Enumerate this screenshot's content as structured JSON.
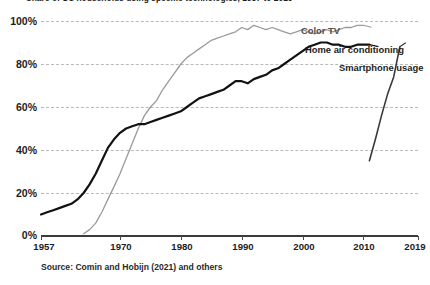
{
  "chart": {
    "title": "Share of US households using specific technologies, 1957 to 2019",
    "source": "Source: Comin and Hobijn (2021) and others"
  },
  "axes": {
    "y_ticks": [
      "0%",
      "20%",
      "40%",
      "60%",
      "80%",
      "100%"
    ],
    "x_ticks": [
      "1957",
      "1970",
      "1980",
      "1990",
      "2000",
      "2010",
      "2019"
    ]
  },
  "legend": {
    "color_tv": "Color TV",
    "home_air_conditioning": "Home air conditioning",
    "smartphone_usage": "Smartphone usage"
  },
  "colors": {
    "color_tv": "#9a9a9a",
    "home_air_conditioning": "#121212",
    "smartphone_usage": "#3a3a3a",
    "gridline": "#b9b9b9",
    "axis": "#3b3b3b",
    "text": "#1d1d1d"
  },
  "chart_data": {
    "type": "line",
    "title": "Share of US households using specific technologies, 1957 to 2019",
    "xlabel": "",
    "ylabel": "Share of US households",
    "xlim": [
      1957,
      2019
    ],
    "ylim": [
      0,
      100
    ],
    "grid": true,
    "legend_position": "inline-right",
    "y_tick_values": [
      0,
      20,
      40,
      60,
      80,
      100
    ],
    "x_tick_values": [
      1957,
      1970,
      1980,
      1990,
      2000,
      2010,
      2019
    ],
    "series": [
      {
        "name": "Color TV",
        "color": "#9a9a9a",
        "x": [
          1964,
          1965,
          1966,
          1967,
          1968,
          1969,
          1970,
          1971,
          1972,
          1973,
          1974,
          1975,
          1976,
          1977,
          1978,
          1979,
          1980,
          1981,
          1982,
          1983,
          1984,
          1985,
          1986,
          1987,
          1988,
          1989,
          1990,
          1991,
          1992,
          1993,
          1994,
          1995,
          1996,
          1997,
          1998,
          1999,
          2000,
          2001,
          2002,
          2003,
          2004,
          2005,
          2006,
          2007,
          2008,
          2009,
          2010
        ],
        "values": [
          1,
          3,
          6,
          11,
          17,
          23,
          29,
          36,
          43,
          50,
          56,
          60,
          63,
          68,
          72,
          76,
          80,
          83,
          85,
          87,
          89,
          91,
          92,
          93,
          94,
          95,
          97,
          96,
          98,
          97,
          96,
          97,
          96,
          95,
          94,
          95,
          96,
          95,
          94,
          95,
          96,
          95,
          96,
          97,
          97,
          98,
          98
        ]
      },
      {
        "name": "Home air conditioning",
        "color": "#121212",
        "x": [
          1957,
          1958,
          1959,
          1960,
          1961,
          1962,
          1963,
          1964,
          1965,
          1966,
          1967,
          1968,
          1969,
          1970,
          1971,
          1972,
          1973,
          1974,
          1975,
          1976,
          1977,
          1978,
          1979,
          1980,
          1981,
          1982,
          1983,
          1984,
          1985,
          1986,
          1987,
          1988,
          1989,
          1990,
          1991,
          1992,
          1993,
          1994,
          1995,
          1996,
          1997,
          1998,
          1999,
          2000,
          2001,
          2002,
          2003,
          2004,
          2005,
          2006,
          2007,
          2008,
          2009,
          2010,
          2011
        ],
        "values": [
          10,
          11,
          12,
          13,
          14,
          15,
          17,
          20,
          24,
          29,
          35,
          41,
          45,
          48,
          50,
          51,
          52,
          52,
          53,
          54,
          55,
          56,
          57,
          58,
          60,
          62,
          64,
          65,
          66,
          67,
          68,
          70,
          72,
          72,
          71,
          73,
          74,
          75,
          77,
          78,
          80,
          82,
          84,
          86,
          88,
          89,
          90,
          90,
          89,
          89,
          88,
          88,
          89,
          89,
          89
        ]
      },
      {
        "name": "Smartphone usage",
        "color": "#3a3a3a",
        "x": [
          2011,
          2012,
          2013,
          2014,
          2015,
          2016
        ],
        "values": [
          35,
          45,
          56,
          66,
          74,
          88
        ]
      }
    ]
  }
}
